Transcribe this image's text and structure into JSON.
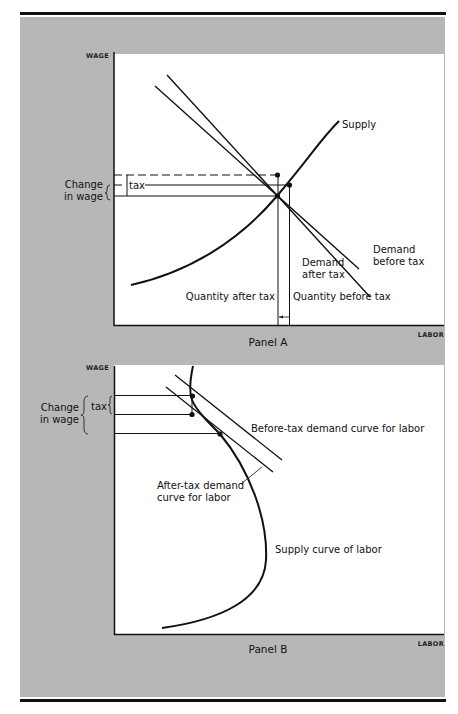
{
  "figure": {
    "panel_a": {
      "title": "Panel A",
      "y_axis_label": "WAGE",
      "x_axis_label": "LABOR",
      "curves": {
        "supply": "Supply",
        "demand_before_line1": "Demand",
        "demand_before_line2": "before tax",
        "demand_after_line1": "Demand",
        "demand_after_line2": "after tax"
      },
      "annotations": {
        "change_line1": "Change",
        "change_line2": "in wage",
        "tax": "tax",
        "quantity_after": "Quantity after tax",
        "quantity_before": "Quantity before tax"
      }
    },
    "panel_b": {
      "title": "Panel B",
      "y_axis_label": "WAGE",
      "x_axis_label": "LABOR",
      "curves": {
        "before_tax_demand": "Before-tax demand curve for labor",
        "after_tax_line1": "After-tax demand",
        "after_tax_line2": "curve for labor",
        "supply": "Supply curve of labor"
      },
      "annotations": {
        "change_line1": "Change",
        "change_line2": "in wage",
        "tax": "tax"
      }
    },
    "colors": {
      "background_panel": "#b7b7b7",
      "plot_area": "#ffffff",
      "ink": "#111111"
    }
  }
}
